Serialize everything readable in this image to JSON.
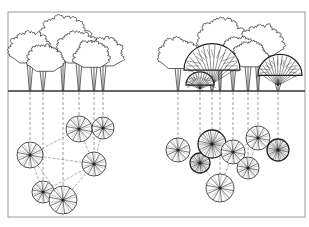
{
  "diagram": {
    "type": "tree-planting elevation and plan",
    "frame": {
      "x": 8,
      "y": 12,
      "w": 297,
      "h": 205,
      "stroke": "#9a9a9a"
    },
    "ground_line": {
      "y": 91,
      "x1": 8,
      "x2": 305,
      "stroke": "#333333"
    },
    "colors": {
      "ink": "#222222",
      "dash": "#777777",
      "light": "#555555"
    },
    "left_group": {
      "label": "grove-left",
      "elevation_trees": [
        {
          "x": 30,
          "crown_cx": 30,
          "crown_cy": 52,
          "crown_r": 20,
          "style": "outline"
        },
        {
          "x": 43,
          "crown_cx": 45,
          "crown_cy": 62,
          "crown_r": 17,
          "style": "outline"
        },
        {
          "x": 63,
          "crown_cx": 64,
          "crown_cy": 40,
          "crown_r": 24,
          "style": "outline"
        },
        {
          "x": 79,
          "crown_cx": 78,
          "crown_cy": 52,
          "crown_r": 20,
          "style": "outline"
        },
        {
          "x": 94,
          "crown_cx": 92,
          "crown_cy": 58,
          "crown_r": 17,
          "style": "outline"
        },
        {
          "x": 103,
          "crown_cx": 104,
          "crown_cy": 56,
          "crown_r": 18,
          "style": "outline"
        }
      ],
      "plan_trees": [
        {
          "cx": 30,
          "cy": 155,
          "r": 13,
          "dark": false
        },
        {
          "cx": 43,
          "cy": 192,
          "r": 11,
          "dark": false
        },
        {
          "cx": 63,
          "cy": 200,
          "r": 14,
          "dark": false
        },
        {
          "cx": 79,
          "cy": 129,
          "r": 13,
          "dark": false
        },
        {
          "cx": 94,
          "cy": 164,
          "r": 12,
          "dark": false
        },
        {
          "cx": 103,
          "cy": 128,
          "r": 11,
          "dark": false
        }
      ],
      "connections": [
        [
          0,
          3
        ],
        [
          0,
          4
        ],
        [
          0,
          1
        ],
        [
          0,
          2
        ],
        [
          1,
          4
        ],
        [
          2,
          4
        ],
        [
          3,
          4
        ],
        [
          3,
          5
        ],
        [
          4,
          5
        ],
        [
          1,
          2
        ]
      ]
    },
    "right_group": {
      "label": "grove-right",
      "elevation_trees": [
        {
          "x": 178,
          "crown_cx": 178,
          "crown_cy": 58,
          "crown_r": 19,
          "style": "outline"
        },
        {
          "x": 200,
          "crown_cx": 200,
          "crown_cy": 83,
          "crown_r": 14,
          "style": "dense"
        },
        {
          "x": 212,
          "crown_cx": 212,
          "crown_cy": 66,
          "crown_r": 28,
          "style": "dense"
        },
        {
          "x": 220,
          "crown_cx": 222,
          "crown_cy": 42,
          "crown_r": 22,
          "style": "outline"
        },
        {
          "x": 233,
          "crown_cx": 238,
          "crown_cy": 55,
          "crown_r": 18,
          "style": "outline"
        },
        {
          "x": 248,
          "crown_cx": 250,
          "crown_cy": 58,
          "crown_r": 16,
          "style": "outline"
        },
        {
          "x": 258,
          "crown_cx": 262,
          "crown_cy": 45,
          "crown_r": 20,
          "style": "outline"
        },
        {
          "x": 278,
          "crown_cx": 280,
          "crown_cy": 72,
          "crown_r": 22,
          "style": "dense"
        }
      ],
      "plan_trees": [
        {
          "cx": 178,
          "cy": 150,
          "r": 12,
          "dark": false
        },
        {
          "cx": 200,
          "cy": 163,
          "r": 10,
          "dark": true
        },
        {
          "cx": 212,
          "cy": 144,
          "r": 14,
          "dark": true
        },
        {
          "cx": 220,
          "cy": 188,
          "r": 14,
          "dark": false
        },
        {
          "cx": 233,
          "cy": 152,
          "r": 12,
          "dark": false
        },
        {
          "cx": 248,
          "cy": 168,
          "r": 11,
          "dark": false
        },
        {
          "cx": 258,
          "cy": 138,
          "r": 12,
          "dark": false
        },
        {
          "cx": 278,
          "cy": 150,
          "r": 11,
          "dark": true
        }
      ],
      "connections": [
        [
          0,
          1
        ],
        [
          1,
          3
        ],
        [
          3,
          4
        ],
        [
          4,
          5
        ],
        [
          4,
          6
        ],
        [
          5,
          6
        ],
        [
          2,
          4
        ]
      ]
    }
  }
}
